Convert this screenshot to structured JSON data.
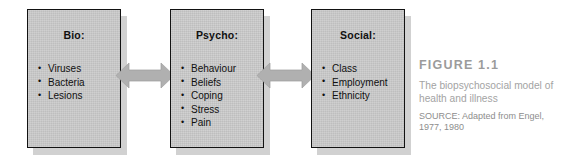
{
  "figure": {
    "boxes": [
      {
        "id": "bio",
        "title": "Bio:",
        "items": [
          "Viruses",
          "Bacteria",
          "Lesions"
        ]
      },
      {
        "id": "psycho",
        "title": "Psycho:",
        "items": [
          "Behaviour",
          "Beliefs",
          "Coping",
          "Stress",
          "Pain"
        ]
      },
      {
        "id": "social",
        "title": "Social:",
        "items": [
          "Class",
          "Employment",
          "Ethnicity"
        ]
      }
    ],
    "connectors": [
      {
        "id": "bio-psycho",
        "kind": "double-headed-arrow"
      },
      {
        "id": "psycho-social",
        "kind": "double-headed-arrow"
      }
    ],
    "caption": {
      "label": "FIGURE 1.1",
      "description": "The biopsychosocial model of health and illness",
      "source": "SOURCE: Adapted from Engel, 1977, 1980"
    },
    "colors": {
      "box_fill": "#cbcbcb",
      "box_border": "#121212",
      "box_shadow": "#c2c2c2",
      "arrow_fill": "#b0b0b0",
      "caption_title": "#9b9b9b",
      "caption_desc": "#a3a3a3",
      "caption_source": "#8d8d8d",
      "background": "#ffffff"
    }
  }
}
